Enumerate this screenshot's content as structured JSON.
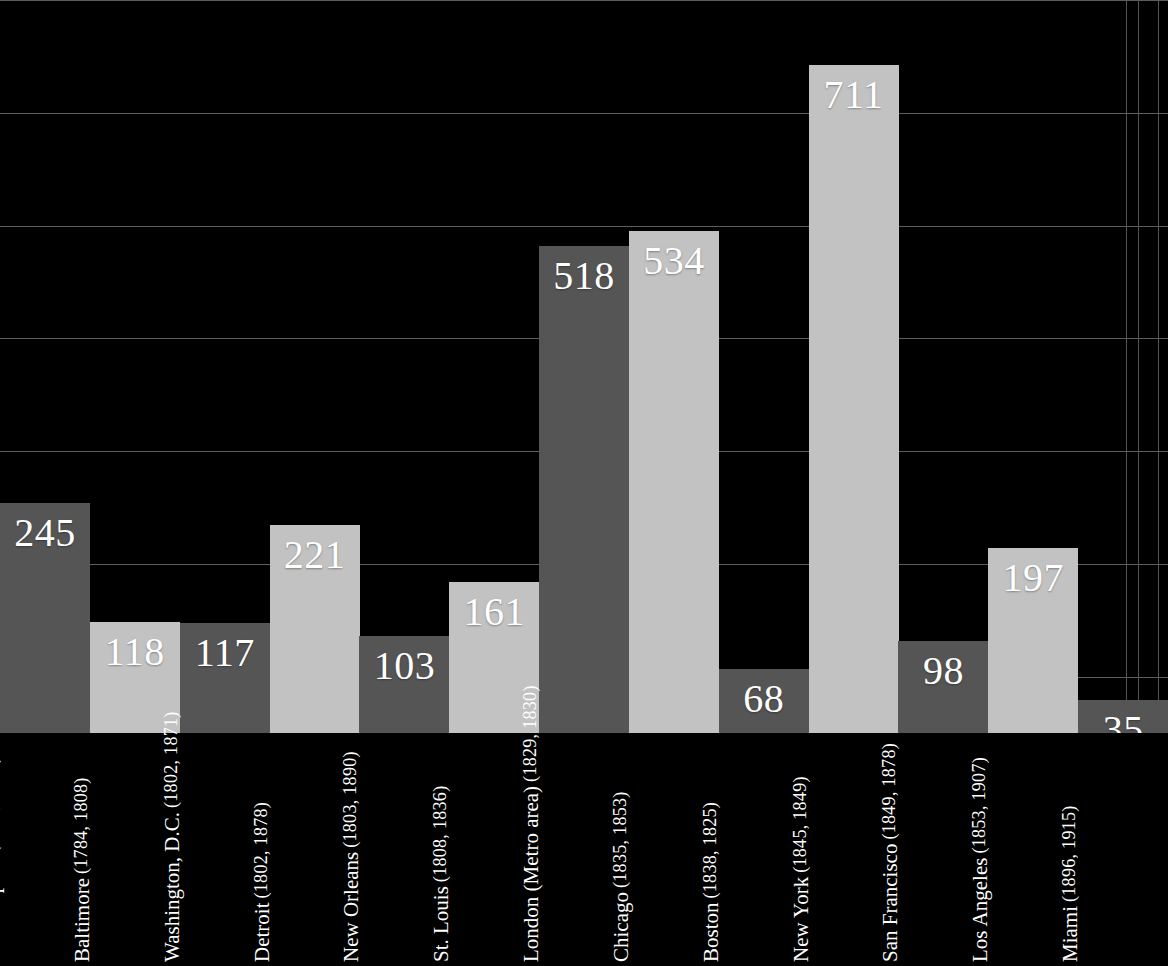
{
  "chart_data": {
    "type": "bar",
    "title": "",
    "subtitle": "",
    "xlabel": "",
    "ylabel": "",
    "grid": true,
    "legend": "none",
    "ylim": [
      0,
      780
    ],
    "gridline_values": [
      780,
      660,
      540,
      420,
      300,
      180,
      60
    ],
    "categories": [
      "Philadelphia",
      "Baltimore",
      "Washington, D.C.",
      "Detroit",
      "New Orleans",
      "St. Louis",
      "London (Metro area)",
      "Chicago",
      "Boston",
      "New York",
      "San Francisco",
      "Los Angeles",
      "Miami"
    ],
    "category_years": [
      "(1751, 1828)",
      "(1784, 1808)",
      "(1802, 1871)",
      "(1802, 1878)",
      "(1803, 1890)",
      "(1808, 1836)",
      "(1829, 1830)",
      "(1835, 1853)",
      "(1838, 1825)",
      "(1845, 1849)",
      "(1849, 1878)",
      "(1853, 1907)",
      "(1896, 1915)"
    ],
    "values": [
      245,
      118,
      117,
      221,
      103,
      161,
      518,
      534,
      68,
      711,
      98,
      197,
      35
    ],
    "value_labels": [
      "245",
      "118",
      "117",
      "221",
      "103",
      "161",
      "518",
      "534",
      "68",
      "711",
      "98",
      "197",
      "35"
    ],
    "colors": {
      "background": "#000000",
      "bar_dark": "#555555",
      "bar_light": "#c2c2c2",
      "gridline": "#6e6e6e",
      "label_text": "#ffffff"
    },
    "bar_shades": [
      "dark",
      "light",
      "dark",
      "light",
      "dark",
      "light",
      "dark",
      "light",
      "dark",
      "light",
      "dark",
      "light",
      "dark"
    ]
  }
}
